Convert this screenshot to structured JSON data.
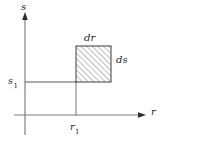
{
  "figure": {
    "name": "differential-area-element-in-rs-plane",
    "background_color": "#ffffff",
    "line_color": "#4d4d4d",
    "text_color": "#1a1a1a",
    "hatch_color": "#5a5a5a"
  },
  "axes": {
    "vertical": {
      "label": "s",
      "icon": "arrow-up-icon",
      "x": 25,
      "y_top": 14,
      "y_bottom": 135,
      "arrow_tip_y": 14
    },
    "horizontal": {
      "label": "r",
      "icon": "arrow-right-icon",
      "y": 115,
      "x_left": 14,
      "x_right": 145,
      "arrow_tip_x": 145
    }
  },
  "ticks": {
    "s1": {
      "label": "s",
      "subscript": "1",
      "value_y": 82,
      "guide_from_x": 25,
      "guide_to_x": 76
    },
    "r1": {
      "label": "r",
      "subscript": "1",
      "value_x": 76,
      "guide_from_y": 82,
      "guide_to_y": 115
    }
  },
  "rectangle": {
    "name": "hatched-area-element",
    "x": 76,
    "y": 46,
    "width": 35,
    "height": 36,
    "fill": "hatched-45-degree",
    "hatch_spacing": 4,
    "stroke": "#4d4d4d"
  },
  "dimensions": {
    "width_label": "dr",
    "height_label": "ds"
  }
}
